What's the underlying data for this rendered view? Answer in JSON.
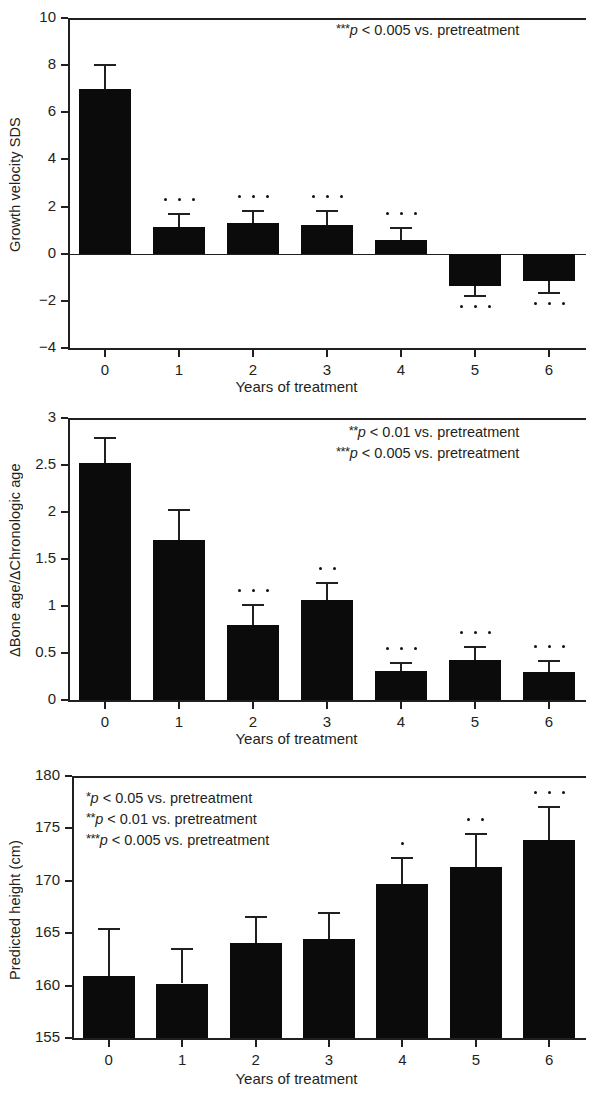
{
  "figure": {
    "xlabel": "Years of treatment"
  },
  "chart_data": [
    {
      "type": "bar",
      "panel": "A",
      "title": "",
      "xlabel": "Years of treatment",
      "ylabel": "Growth velocity SDS",
      "categories": [
        "0",
        "1",
        "2",
        "3",
        "4",
        "5",
        "6"
      ],
      "values": [
        7.0,
        1.15,
        1.3,
        1.2,
        0.6,
        -1.35,
        -1.15
      ],
      "errors": [
        1.0,
        0.55,
        0.5,
        0.6,
        0.5,
        0.45,
        0.5
      ],
      "significance": [
        "",
        "***",
        "***",
        "***",
        "***",
        "***",
        "***"
      ],
      "ylim": [
        -4,
        10
      ],
      "yticks": [
        "10",
        "8",
        "6",
        "4",
        "2",
        "0",
        "-2",
        "-4"
      ],
      "ytick_values": [
        10,
        8,
        6,
        4,
        2,
        0,
        -2,
        -4
      ],
      "grid": false,
      "legend": "none",
      "annotations": [
        {
          "stars": "***",
          "text": "p < 0.005 vs. pretreatment"
        }
      ]
    },
    {
      "type": "bar",
      "panel": "B",
      "title": "",
      "xlabel": "Years of treatment",
      "ylabel": "ΔBone age/ΔChronologic age",
      "categories": [
        "0",
        "1",
        "2",
        "3",
        "4",
        "5",
        "6"
      ],
      "values": [
        2.52,
        1.7,
        0.8,
        1.06,
        0.31,
        0.43,
        0.3
      ],
      "errors": [
        0.27,
        0.32,
        0.21,
        0.19,
        0.08,
        0.13,
        0.11
      ],
      "significance": [
        "",
        "",
        "***",
        "**",
        "***",
        "***",
        "***"
      ],
      "ylim": [
        0,
        3
      ],
      "yticks": [
        "3",
        "2.5",
        "2",
        "1.5",
        "1",
        "0.5",
        "0"
      ],
      "ytick_values": [
        3,
        2.5,
        2,
        1.5,
        1,
        0.5,
        0
      ],
      "grid": false,
      "legend": "none",
      "annotations": [
        {
          "stars": "**",
          "text": "p < 0.01 vs. pretreatment"
        },
        {
          "stars": "***",
          "text": "p < 0.005 vs. pretreatment"
        }
      ]
    },
    {
      "type": "bar",
      "panel": "C",
      "title": "",
      "xlabel": "Years of treatment",
      "ylabel": "Predicted height (cm)",
      "categories": [
        "0",
        "1",
        "2",
        "3",
        "4",
        "5",
        "6"
      ],
      "values": [
        160.9,
        160.2,
        164.1,
        164.4,
        169.7,
        171.3,
        173.9
      ],
      "errors": [
        4.5,
        3.3,
        2.4,
        2.5,
        2.5,
        3.2,
        3.1
      ],
      "significance": [
        "",
        "",
        "",
        "",
        "*",
        "**",
        "***"
      ],
      "ylim": [
        155,
        180
      ],
      "yticks": [
        "180",
        "175",
        "170",
        "165",
        "160",
        "155"
      ],
      "ytick_values": [
        180,
        175,
        170,
        165,
        160,
        155
      ],
      "grid": false,
      "legend": "none",
      "annotations": [
        {
          "stars": "*",
          "text": "p < 0.05 vs. pretreatment"
        },
        {
          "stars": "**",
          "text": "p < 0.01 vs. pretreatment"
        },
        {
          "stars": "***",
          "text": "p < 0.005 vs. pretreatment"
        }
      ]
    }
  ]
}
